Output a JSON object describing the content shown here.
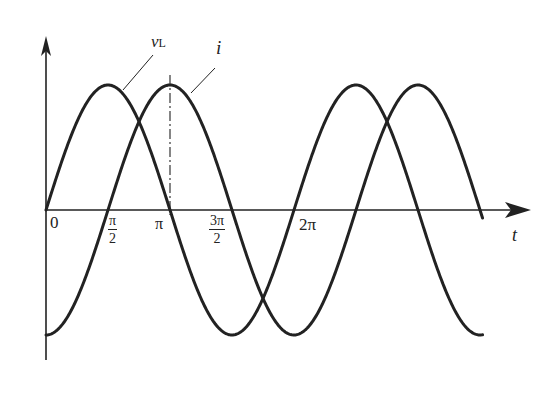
{
  "figure": {
    "curve_labels": {
      "voltage": "v",
      "voltage_sub": "L",
      "current": "i"
    },
    "axis_labels": {
      "x": "t"
    },
    "ticks": {
      "origin": "0",
      "half_pi": {
        "num": "π",
        "den": "2"
      },
      "pi": "π",
      "three_half_pi": {
        "num": "3π",
        "den": "2"
      },
      "two_pi": "2π"
    }
  },
  "chart_data": {
    "type": "line",
    "title": "",
    "xlabel": "t",
    "ylabel": "",
    "x_ticks": [
      "0",
      "π/2",
      "π",
      "3π/2",
      "2π"
    ],
    "x_range": [
      0,
      "7π/2"
    ],
    "series": [
      {
        "name": "v_L",
        "function": "sin(t)",
        "amplitude": 1,
        "phase": "leads i by π/2"
      },
      {
        "name": "i",
        "function": "-cos(t)",
        "amplitude": 1,
        "phase": "lags v_L by π/2"
      }
    ],
    "annotations": [
      "dash-dot vertical line at t = π marking peak of i"
    ],
    "grid": false,
    "color": "#222222"
  }
}
